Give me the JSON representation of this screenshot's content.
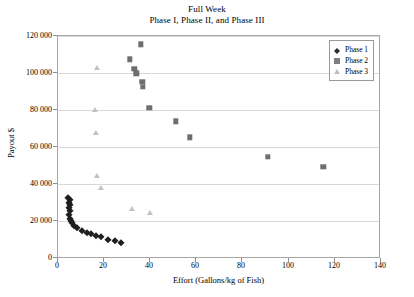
{
  "chart": {
    "title_lines": [
      "Full Week",
      "Phase I, Phase II, and Phase III"
    ]
  },
  "axes": {
    "x_title": "Effort (Gallons/kg of Fish)",
    "y_title": "Payout $",
    "x_ticks": [
      "0",
      "20",
      "40",
      "60",
      "80",
      "100",
      "120",
      "140"
    ],
    "y_ticks": [
      "120 000",
      "100 000",
      "80 000",
      "60 000",
      "40 000",
      "20 000",
      "0"
    ]
  },
  "legend": {
    "items": [
      {
        "label": "Phase 1",
        "marker": "diamond-marker",
        "color": "#1f1f1f"
      },
      {
        "label": "Phase 2",
        "marker": "square-marker",
        "color": "#6e6e6e"
      },
      {
        "label": "Phase 3",
        "marker": "triangle-marker",
        "color": "#c2c2c2"
      }
    ]
  },
  "chart_data": {
    "type": "scatter",
    "xlabel": "Effort (Gallons/kg of Fish)",
    "ylabel": "Payout $",
    "xlim": [
      0,
      140
    ],
    "ylim": [
      0,
      120000
    ],
    "xticks": [
      0,
      20,
      40,
      60,
      80,
      100,
      120,
      140
    ],
    "yticks": [
      0,
      20000,
      40000,
      60000,
      80000,
      100000,
      120000
    ],
    "grid": "horizontal",
    "legend_position": "top-right-inside",
    "series": [
      {
        "name": "Phase 1",
        "marker": "diamond",
        "color": "#1f1f1f",
        "points": [
          [
            4.5,
            33000
          ],
          [
            5.0,
            31500
          ],
          [
            4.8,
            30000
          ],
          [
            5.4,
            28800
          ],
          [
            4.6,
            27500
          ],
          [
            5.2,
            26000
          ],
          [
            4.9,
            23500
          ],
          [
            5.0,
            21500
          ],
          [
            5.6,
            20500
          ],
          [
            6.2,
            19200
          ],
          [
            7.0,
            17800
          ],
          [
            8.4,
            16500
          ],
          [
            10.5,
            15200
          ],
          [
            12.5,
            14000
          ],
          [
            14.5,
            13200
          ],
          [
            16.5,
            12500
          ],
          [
            18.5,
            11800
          ],
          [
            21.5,
            10200
          ],
          [
            24.5,
            9500
          ],
          [
            27.5,
            8800
          ]
        ]
      },
      {
        "name": "Phase 2",
        "marker": "square",
        "color": "#6e6e6e",
        "points": [
          [
            36.0,
            115500
          ],
          [
            31.0,
            107500
          ],
          [
            33.0,
            102500
          ],
          [
            34.0,
            100000
          ],
          [
            36.5,
            95500
          ],
          [
            36.8,
            92500
          ],
          [
            39.5,
            81500
          ],
          [
            51.0,
            74000
          ],
          [
            57.0,
            65500
          ],
          [
            91.0,
            55000
          ],
          [
            115.0,
            49500
          ]
        ]
      },
      {
        "name": "Phase 3",
        "marker": "triangle",
        "color": "#c2c2c2",
        "points": [
          [
            17.0,
            103000
          ],
          [
            16.0,
            80000
          ],
          [
            16.5,
            68000
          ],
          [
            17.0,
            44500
          ],
          [
            18.5,
            38000
          ],
          [
            32.0,
            27000
          ],
          [
            40.0,
            24500
          ]
        ]
      }
    ]
  }
}
